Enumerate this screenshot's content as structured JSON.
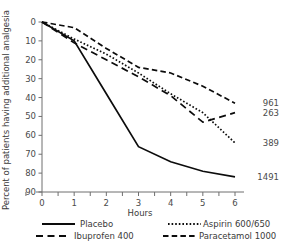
{
  "chart_data": {
    "type": "line",
    "title": "",
    "xlabel": "Hours",
    "ylabel": "Percent of patients having additional analgesia",
    "x": [
      0,
      1,
      2,
      3,
      4,
      5,
      6
    ],
    "xlim": [
      0,
      6
    ],
    "ylim": [
      0,
      90
    ],
    "y_inverted": true,
    "grid": false,
    "legend_position": "bottom",
    "xticks": [
      "0",
      "1",
      "2",
      "3",
      "4",
      "5",
      "6"
    ],
    "yticks": [
      "0",
      "10",
      "20",
      "30",
      "40",
      "50",
      "60",
      "70",
      "80",
      "90"
    ],
    "series": [
      {
        "name": "Placebo",
        "dash": "solid",
        "end_label": "1491",
        "values": [
          0,
          10,
          38,
          66,
          74,
          79,
          82
        ]
      },
      {
        "name": "Aspirin 600/650",
        "dash": "dotted",
        "end_label": "389",
        "values": [
          0,
          9,
          17,
          27,
          38,
          48,
          64
        ]
      },
      {
        "name": "Ibuprofen 400",
        "dash": "dashdot",
        "end_label": "263",
        "values": [
          0,
          11,
          20,
          29,
          39,
          53,
          48
        ]
      },
      {
        "name": "Paracetamol 1000",
        "dash": "dashed",
        "end_label": "961",
        "values": [
          0,
          3,
          14,
          24,
          27,
          34,
          43
        ]
      }
    ],
    "end_labels": [
      "961",
      "263",
      "389",
      "1491"
    ]
  },
  "legend": {
    "entries": [
      {
        "label": "Placebo"
      },
      {
        "label": "Aspirin 600/650"
      },
      {
        "label": "Ibuprofen 400"
      },
      {
        "label": "Paracetamol 1000"
      }
    ]
  }
}
